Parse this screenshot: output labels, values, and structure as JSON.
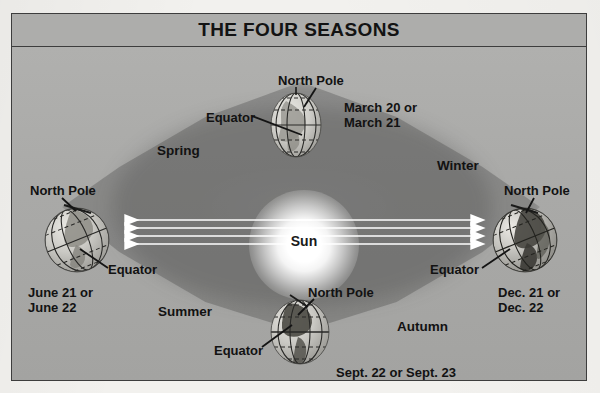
{
  "figure": {
    "title": "THE FOUR SEASONS",
    "background_color": "#a8a8a6",
    "border_color": "#3d3d3d"
  },
  "sun": {
    "label": "Sun",
    "glow_color": "#ffffff"
  },
  "rays": {
    "count_per_side": 4,
    "color": "#ffffff",
    "left_direction": "left",
    "right_direction": "right"
  },
  "seasons": [
    {
      "name": "spring",
      "label": "Spring"
    },
    {
      "name": "summer",
      "label": "Summer"
    },
    {
      "name": "autumn",
      "label": "Autumn"
    },
    {
      "name": "winter",
      "label": "Winter"
    }
  ],
  "globes": [
    {
      "id": "top",
      "position": "top",
      "north_pole_label": "North Pole",
      "equator_label": "Equator",
      "date_label": "March 20 or\nMarch 21",
      "adjacent_seasons": [
        "Spring",
        "Winter"
      ]
    },
    {
      "id": "left",
      "position": "left",
      "north_pole_label": "North Pole",
      "equator_label": "Equator",
      "date_label": "June 21 or\nJune 22",
      "adjacent_seasons": [
        "Spring",
        "Summer"
      ]
    },
    {
      "id": "bottom",
      "position": "bottom",
      "north_pole_label": "North Pole",
      "equator_label": "Equator",
      "date_label": "Sept. 22 or Sept. 23",
      "adjacent_seasons": [
        "Summer",
        "Autumn"
      ]
    },
    {
      "id": "right",
      "position": "right",
      "north_pole_label": "North Pole",
      "equator_label": "Equator",
      "date_label": "Dec. 21 or\nDec. 22",
      "adjacent_seasons": [
        "Autumn",
        "Winter"
      ]
    }
  ],
  "labels": {
    "spring": "Spring",
    "summer": "Summer",
    "autumn": "Autumn",
    "winter": "Winter",
    "top_north_pole": "North Pole",
    "top_equator": "Equator",
    "top_date": "March 20 or\nMarch 21",
    "left_north_pole": "North Pole",
    "left_equator": "Equator",
    "left_date": "June 21 or\nJune 22",
    "bottom_north_pole": "North Pole",
    "bottom_equator": "Equator",
    "bottom_date": "Sept. 22 or Sept. 23",
    "right_north_pole": "North Pole",
    "right_equator": "Equator",
    "right_date": "Dec. 21 or\nDec. 22"
  }
}
